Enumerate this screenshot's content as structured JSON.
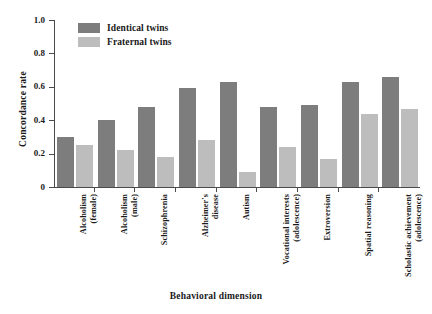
{
  "chart_data": {
    "type": "bar",
    "title": "",
    "xlabel": "Behavioral dimension",
    "ylabel": "Concordance rate",
    "ylim": [
      0,
      1.0
    ],
    "ytick_labels": [
      "1.0",
      "0.8",
      "0.6",
      "0.4",
      "0.2",
      "0"
    ],
    "ytick_values": [
      1.0,
      0.8,
      0.6,
      0.4,
      0.2,
      0
    ],
    "grid": false,
    "legend_position": "top-left-inside",
    "categories": [
      "Alcoholism\n(female)",
      "Alcoholism\n(male)",
      "Schizophrenia",
      "Alzheimer's\ndisease",
      "Autism",
      "Vocational interests\n(adolescence)",
      "Extroversion",
      "Spatial reasoning",
      "Scholastic achievement\n(adolescence)"
    ],
    "series": [
      {
        "name": "Identical twins",
        "color": "#7d7d7d",
        "values": [
          0.3,
          0.4,
          0.48,
          0.59,
          0.63,
          0.48,
          0.49,
          0.63,
          0.66
        ]
      },
      {
        "name": "Fraternal twins",
        "color": "#bdbdbd",
        "values": [
          0.25,
          0.22,
          0.18,
          0.28,
          0.09,
          0.24,
          0.17,
          0.44,
          0.47
        ]
      }
    ]
  }
}
